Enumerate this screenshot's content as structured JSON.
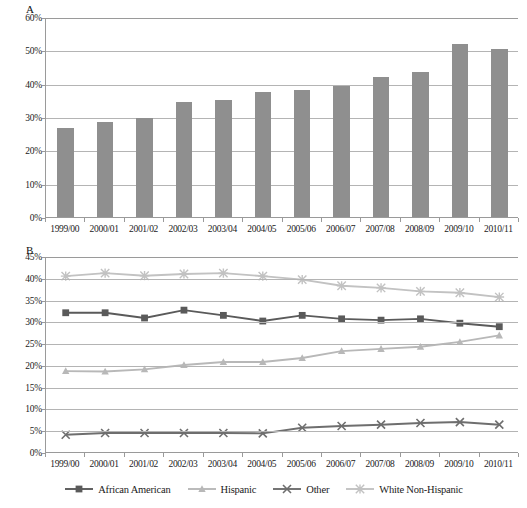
{
  "panels": {
    "a": {
      "letter": "A",
      "yticks": [
        "0%",
        "10%",
        "20%",
        "30%",
        "40%",
        "50%",
        "60%"
      ]
    },
    "b": {
      "letter": "B",
      "yticks": [
        "0%",
        "5%",
        "10%",
        "15%",
        "20%",
        "25%",
        "30%",
        "35%",
        "40%",
        "45%"
      ]
    }
  },
  "categories": [
    "1999/00",
    "2000/01",
    "2001/02",
    "2002/03",
    "2003/04",
    "2004/05",
    "2005/06",
    "2006/07",
    "2007/08",
    "2008/09",
    "2009/10",
    "2010/11"
  ],
  "legend": [
    {
      "label": "African American",
      "marker": "square",
      "color": "#5a5a5a"
    },
    {
      "label": "Hispanic",
      "marker": "triangle",
      "color": "#b8b8b8"
    },
    {
      "label": "Other",
      "marker": "x",
      "color": "#6e6e6e"
    },
    {
      "label": "White Non-Hispanic",
      "marker": "asterisk",
      "color": "#c2c2c2"
    }
  ],
  "colors": {
    "bar": "#8f8f8f",
    "grid": "#b4b4b4",
    "axis": "#9a9a9a",
    "african_american": "#5a5a5a",
    "hispanic": "#b8b8b8",
    "other": "#6e6e6e",
    "white_non_hispanic": "#c2c2c2"
  },
  "chart_data": [
    {
      "type": "bar",
      "panel": "A",
      "title": "",
      "xlabel": "",
      "ylabel": "",
      "categories": [
        "1999/00",
        "2000/01",
        "2001/02",
        "2002/03",
        "2003/04",
        "2004/05",
        "2005/06",
        "2006/07",
        "2007/08",
        "2008/09",
        "2009/10",
        "2010/11"
      ],
      "values": [
        26.7,
        28.5,
        29.7,
        34.6,
        35.1,
        37.4,
        38.1,
        39.3,
        42.0,
        43.6,
        51.8,
        50.4
      ],
      "ylim": [
        0,
        60
      ],
      "ytick_step": 10,
      "grid": true,
      "legend": "none"
    },
    {
      "type": "line",
      "panel": "B",
      "title": "",
      "xlabel": "",
      "ylabel": "",
      "categories": [
        "1999/00",
        "2000/01",
        "2001/02",
        "2002/03",
        "2003/04",
        "2004/05",
        "2005/06",
        "2006/07",
        "2007/08",
        "2008/09",
        "2009/10",
        "2010/11"
      ],
      "series": [
        {
          "name": "African American",
          "marker": "square",
          "color": "#5a5a5a",
          "values": [
            32.2,
            32.2,
            31.0,
            32.8,
            31.6,
            30.3,
            31.6,
            30.8,
            30.5,
            30.8,
            29.8,
            29.0
          ]
        },
        {
          "name": "Hispanic",
          "marker": "triangle",
          "color": "#b8b8b8",
          "values": [
            18.8,
            18.7,
            19.2,
            20.2,
            20.9,
            20.9,
            21.8,
            23.4,
            23.9,
            24.4,
            25.5,
            27.0
          ]
        },
        {
          "name": "Other",
          "marker": "x",
          "color": "#6e6e6e",
          "values": [
            4.2,
            4.6,
            4.6,
            4.6,
            4.6,
            4.5,
            5.8,
            6.2,
            6.5,
            6.9,
            7.1,
            6.5
          ]
        },
        {
          "name": "White Non-Hispanic",
          "marker": "asterisk",
          "color": "#c2c2c2",
          "values": [
            40.6,
            41.3,
            40.7,
            41.1,
            41.3,
            40.6,
            39.8,
            38.4,
            37.9,
            37.1,
            36.8,
            35.8
          ]
        }
      ],
      "ylim": [
        0,
        45
      ],
      "ytick_step": 5,
      "grid": true,
      "legend": "bottom"
    }
  ]
}
